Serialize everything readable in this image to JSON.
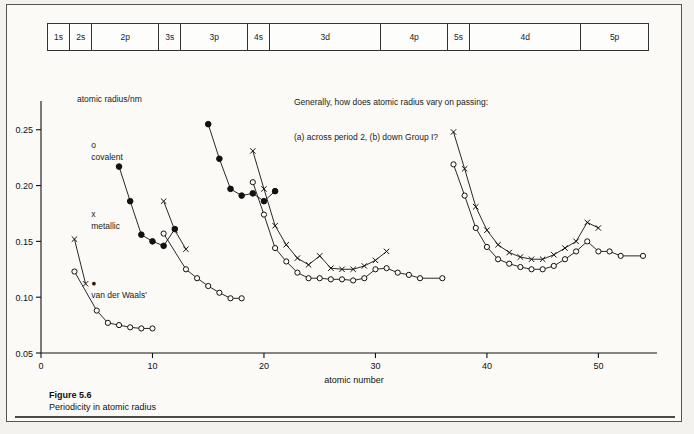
{
  "figure": {
    "caption_title": "Figure 5.6",
    "caption_text": "Periodicity in atomic radius"
  },
  "blocks": {
    "items": [
      {
        "label": "1s",
        "start": 1,
        "end": 2
      },
      {
        "label": "2s",
        "start": 3,
        "end": 4
      },
      {
        "label": "2p",
        "start": 5,
        "end": 10
      },
      {
        "label": "3s",
        "start": 11,
        "end": 12
      },
      {
        "label": "3p",
        "start": 13,
        "end": 18
      },
      {
        "label": "4s",
        "start": 19,
        "end": 20
      },
      {
        "label": "3d",
        "start": 21,
        "end": 30
      },
      {
        "label": "4p",
        "start": 31,
        "end": 36
      },
      {
        "label": "5s",
        "start": 37,
        "end": 38
      },
      {
        "label": "4d",
        "start": 39,
        "end": 48
      },
      {
        "label": "5p",
        "start": 49,
        "end": 54
      }
    ]
  },
  "legend": {
    "title": "atomic radius/nm",
    "entries": [
      {
        "marker": "o",
        "label": "covalent"
      },
      {
        "marker": "x",
        "label": "metallic"
      },
      {
        "marker": "●",
        "label": "van der Waals'"
      }
    ]
  },
  "question": {
    "line1": "Generally, how does atomic radius vary on passing:",
    "line2": "(a) across period 2, (b) down Group I?"
  },
  "colors": {
    "ink": "#111111",
    "frame": "#555555",
    "paper": "#fbfaf7"
  },
  "chart_data": {
    "type": "line",
    "title": "Periodicity in atomic radius",
    "xlabel": "atomic number",
    "ylabel": "atomic radius/nm",
    "xlim": [
      0,
      54
    ],
    "ylim": [
      0.05,
      0.265
    ],
    "xticks": [
      0,
      10,
      20,
      30,
      40,
      50
    ],
    "yticks": [
      0.05,
      0.1,
      0.15,
      0.2,
      0.25
    ],
    "ytick_labels": [
      "0.05",
      "0.10",
      "0.15",
      "0.20",
      "0.25"
    ],
    "grid": false,
    "legend_position": "upper-left",
    "series": [
      {
        "name": "covalent",
        "marker": "o",
        "segments": [
          {
            "points": [
              {
                "x": 3,
                "y": 0.123
              },
              {
                "x": 5,
                "y": 0.088
              },
              {
                "x": 6,
                "y": 0.077
              },
              {
                "x": 7,
                "y": 0.075
              },
              {
                "x": 8,
                "y": 0.073
              },
              {
                "x": 9,
                "y": 0.072
              },
              {
                "x": 10,
                "y": 0.072
              }
            ]
          },
          {
            "points": [
              {
                "x": 11,
                "y": 0.157
              },
              {
                "x": 13,
                "y": 0.125
              },
              {
                "x": 14,
                "y": 0.117
              },
              {
                "x": 15,
                "y": 0.11
              },
              {
                "x": 16,
                "y": 0.104
              },
              {
                "x": 17,
                "y": 0.099
              },
              {
                "x": 18,
                "y": 0.099
              }
            ]
          },
          {
            "points": [
              {
                "x": 19,
                "y": 0.203
              },
              {
                "x": 20,
                "y": 0.174
              },
              {
                "x": 21,
                "y": 0.144
              },
              {
                "x": 22,
                "y": 0.132
              },
              {
                "x": 23,
                "y": 0.122
              },
              {
                "x": 24,
                "y": 0.117
              },
              {
                "x": 25,
                "y": 0.117
              },
              {
                "x": 26,
                "y": 0.116
              },
              {
                "x": 27,
                "y": 0.116
              },
              {
                "x": 28,
                "y": 0.115
              },
              {
                "x": 29,
                "y": 0.117
              },
              {
                "x": 30,
                "y": 0.125
              },
              {
                "x": 31,
                "y": 0.126
              },
              {
                "x": 32,
                "y": 0.122
              },
              {
                "x": 33,
                "y": 0.12
              },
              {
                "x": 34,
                "y": 0.117
              },
              {
                "x": 36,
                "y": 0.117
              }
            ]
          },
          {
            "points": [
              {
                "x": 37,
                "y": 0.219
              },
              {
                "x": 38,
                "y": 0.191
              },
              {
                "x": 39,
                "y": 0.162
              },
              {
                "x": 40,
                "y": 0.145
              },
              {
                "x": 41,
                "y": 0.134
              },
              {
                "x": 42,
                "y": 0.13
              },
              {
                "x": 43,
                "y": 0.127
              },
              {
                "x": 44,
                "y": 0.125
              },
              {
                "x": 45,
                "y": 0.125
              },
              {
                "x": 46,
                "y": 0.128
              },
              {
                "x": 47,
                "y": 0.134
              },
              {
                "x": 48,
                "y": 0.141
              },
              {
                "x": 49,
                "y": 0.15
              },
              {
                "x": 50,
                "y": 0.141
              },
              {
                "x": 51,
                "y": 0.141
              },
              {
                "x": 52,
                "y": 0.137
              },
              {
                "x": 54,
                "y": 0.137
              }
            ]
          }
        ]
      },
      {
        "name": "metallic",
        "marker": "x",
        "segments": [
          {
            "points": [
              {
                "x": 3,
                "y": 0.152
              },
              {
                "x": 4,
                "y": 0.112
              }
            ]
          },
          {
            "points": [
              {
                "x": 11,
                "y": 0.186
              },
              {
                "x": 12,
                "y": 0.16
              },
              {
                "x": 13,
                "y": 0.143
              }
            ]
          },
          {
            "points": [
              {
                "x": 19,
                "y": 0.231
              },
              {
                "x": 20,
                "y": 0.197
              },
              {
                "x": 21,
                "y": 0.164
              },
              {
                "x": 22,
                "y": 0.147
              },
              {
                "x": 23,
                "y": 0.135
              },
              {
                "x": 24,
                "y": 0.129
              },
              {
                "x": 25,
                "y": 0.137
              },
              {
                "x": 26,
                "y": 0.126
              },
              {
                "x": 27,
                "y": 0.125
              },
              {
                "x": 28,
                "y": 0.125
              },
              {
                "x": 29,
                "y": 0.128
              },
              {
                "x": 30,
                "y": 0.133
              },
              {
                "x": 31,
                "y": 0.141
              }
            ]
          },
          {
            "points": [
              {
                "x": 37,
                "y": 0.248
              },
              {
                "x": 38,
                "y": 0.215
              },
              {
                "x": 39,
                "y": 0.181
              },
              {
                "x": 40,
                "y": 0.16
              },
              {
                "x": 41,
                "y": 0.147
              },
              {
                "x": 42,
                "y": 0.14
              },
              {
                "x": 43,
                "y": 0.136
              },
              {
                "x": 44,
                "y": 0.134
              },
              {
                "x": 45,
                "y": 0.134
              },
              {
                "x": 46,
                "y": 0.138
              },
              {
                "x": 47,
                "y": 0.144
              },
              {
                "x": 48,
                "y": 0.15
              },
              {
                "x": 49,
                "y": 0.167
              },
              {
                "x": 50,
                "y": 0.162
              }
            ]
          }
        ]
      },
      {
        "name": "van der Waals'",
        "marker": "●",
        "segments": [
          {
            "points": [
              {
                "x": 7,
                "y": 0.217
              },
              {
                "x": 8,
                "y": 0.186
              },
              {
                "x": 9,
                "y": 0.156
              },
              {
                "x": 10,
                "y": 0.15
              },
              {
                "x": 11,
                "y": 0.146
              },
              {
                "x": 12,
                "y": 0.161
              }
            ]
          },
          {
            "points": [
              {
                "x": 15,
                "y": 0.255
              },
              {
                "x": 16,
                "y": 0.224
              },
              {
                "x": 17,
                "y": 0.197
              },
              {
                "x": 18,
                "y": 0.191
              },
              {
                "x": 19,
                "y": 0.193
              },
              {
                "x": 20,
                "y": 0.186
              },
              {
                "x": 21,
                "y": 0.195
              }
            ]
          }
        ]
      }
    ]
  }
}
